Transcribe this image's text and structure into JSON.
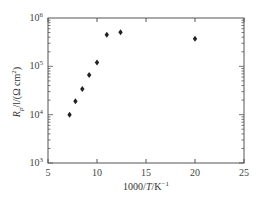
{
  "chart_data": {
    "type": "scatter",
    "title": "",
    "xlabel": "1000/T/K⁻¹",
    "ylabel": "R_p/l/(Ω cm²)",
    "xlim": [
      5,
      25
    ],
    "ylim": [
      1000,
      1000000
    ],
    "yscale": "log",
    "grid": false,
    "legend": null,
    "x_ticks": [
      5,
      10,
      15,
      20,
      25
    ],
    "y_ticks": [
      {
        "value": 1000,
        "base": "10",
        "exp": "3"
      },
      {
        "value": 10000,
        "base": "10",
        "exp": "4"
      },
      {
        "value": 100000,
        "base": "10",
        "exp": "5"
      },
      {
        "value": 1000000,
        "base": "10",
        "exp": "6"
      }
    ],
    "series": [
      {
        "name": "R_p/l",
        "marker": "diamond",
        "color": "#222222",
        "x": [
          7.2,
          7.8,
          8.5,
          9.2,
          10.0,
          11.0,
          12.4,
          20.0
        ],
        "y": [
          10000,
          19000,
          34000,
          66000,
          120000,
          450000,
          510000,
          370000
        ]
      }
    ]
  },
  "labels": {
    "x_axis": {
      "prefix": "1000/",
      "var": "T",
      "suffix": "/K",
      "sup": "−1"
    },
    "y_axis": {
      "var": "R",
      "sub": "p",
      "rest": "/l/(Ω cm",
      "sup": "2",
      "close": ")"
    }
  }
}
